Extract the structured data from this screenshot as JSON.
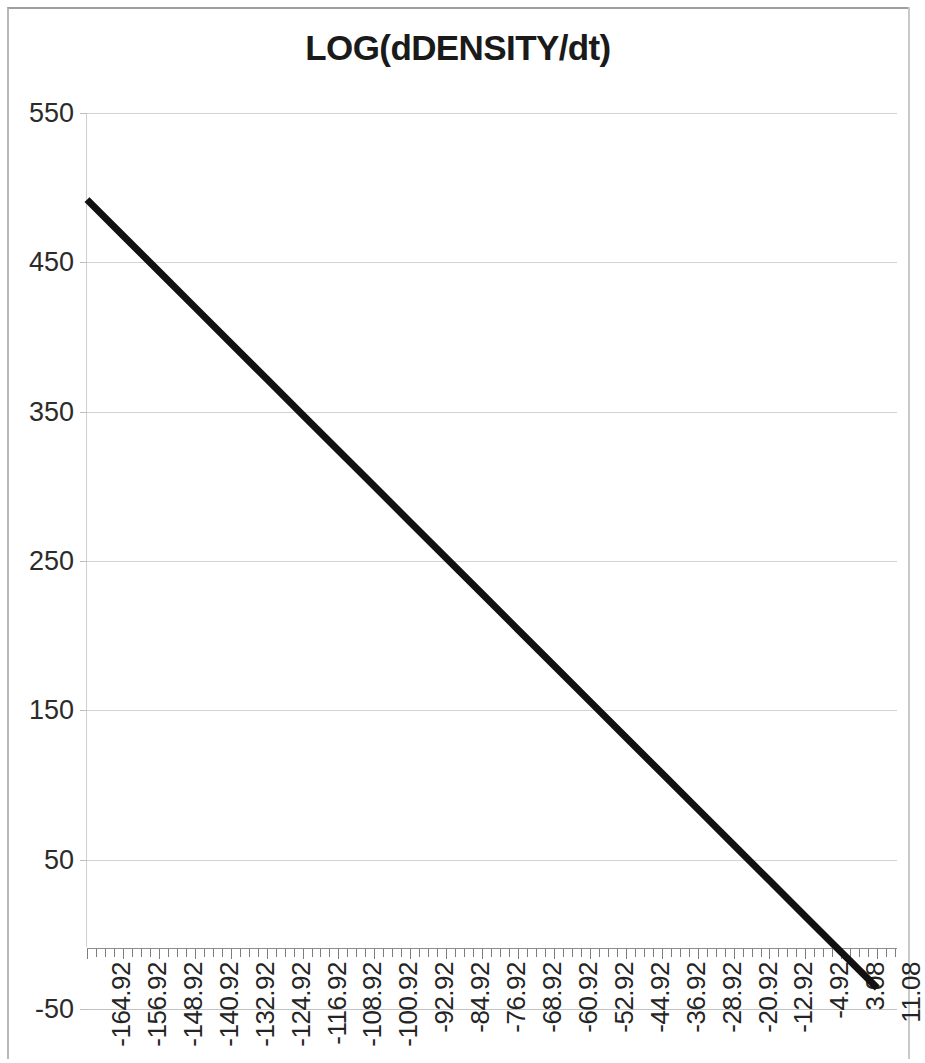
{
  "chart_data": {
    "type": "line",
    "title": "LOG(dDENSITY/dt)",
    "xlabel": "",
    "ylabel": "",
    "grid": true,
    "legend": "none",
    "line_color": "#111111",
    "line_width": 7,
    "ylim": [
      -50,
      550
    ],
    "yticks": [
      550,
      450,
      350,
      250,
      150,
      50,
      -50
    ],
    "ytick_labels": [
      "550",
      "450",
      "350",
      "250",
      "150",
      "50",
      "-50"
    ],
    "categories": [
      "-164.92",
      "-156.92",
      "-148.92",
      "-140.92",
      "-132.92",
      "-124.92",
      "-116.92",
      "-108.92",
      "-100.92",
      "-92.92",
      "-84.92",
      "-76.92",
      "-68.92",
      "-60.92",
      "-52.92",
      "-44.92",
      "-36.92",
      "-28.92",
      "-20.92",
      "-12.92",
      "-4.92",
      "3.08",
      "11.08"
    ],
    "x": [
      -164.92,
      -156.92,
      -148.92,
      -140.92,
      -132.92,
      -124.92,
      -116.92,
      -108.92,
      -100.92,
      -92.92,
      -84.92,
      -76.92,
      -68.92,
      -60.92,
      -52.92,
      -44.92,
      -36.92,
      -28.92,
      -20.92,
      -12.92,
      -4.92,
      3.08,
      11.08
    ],
    "values": [
      492,
      468,
      444,
      420,
      396,
      372,
      348,
      324,
      300,
      276,
      252,
      228,
      204,
      180,
      156,
      132,
      108,
      84,
      60,
      36,
      12,
      -12,
      -36
    ],
    "series": [
      {
        "name": "LOG(dDENSITY/dt)",
        "values": [
          492,
          468,
          444,
          420,
          396,
          372,
          348,
          324,
          300,
          276,
          252,
          228,
          204,
          180,
          156,
          132,
          108,
          84,
          60,
          36,
          12,
          -12,
          -36
        ]
      }
    ],
    "minor_ticks_per_category": 2
  },
  "chart": {
    "title": "LOG(dDENSITY/dt)"
  }
}
